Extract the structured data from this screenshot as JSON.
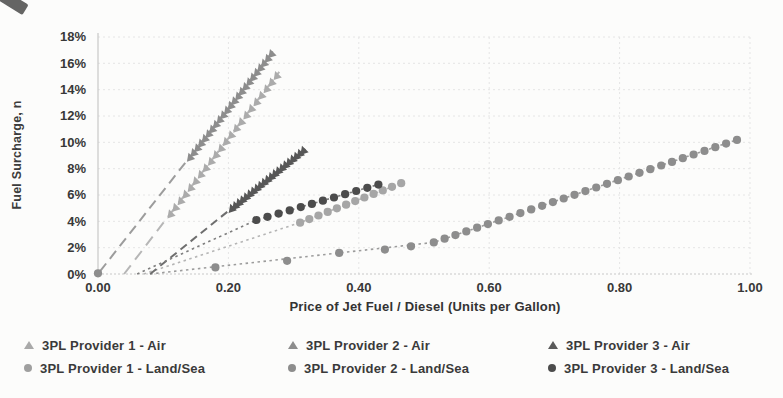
{
  "page": {
    "background": "#fcfcfb"
  },
  "chart_data": {
    "type": "scatter",
    "title": "",
    "xlabel": "Price of Jet Fuel / Diesel (Units per Gallon)",
    "ylabel": "Fuel Surcharge, n",
    "xlim": [
      0.0,
      1.0
    ],
    "ylim_percent": [
      0,
      18
    ],
    "grid": true,
    "legend_position": "bottom",
    "x_ticks": [
      {
        "value": 0.0,
        "label": "0.00"
      },
      {
        "value": 0.2,
        "label": "0.20"
      },
      {
        "value": 0.4,
        "label": "0.40"
      },
      {
        "value": 0.6,
        "label": "0.60"
      },
      {
        "value": 0.8,
        "label": "0.80"
      },
      {
        "value": 1.0,
        "label": "1.00"
      }
    ],
    "y_ticks": [
      {
        "value": 0,
        "label": "0%"
      },
      {
        "value": 2,
        "label": "2%"
      },
      {
        "value": 4,
        "label": "4%"
      },
      {
        "value": 6,
        "label": "6%"
      },
      {
        "value": 8,
        "label": "8%"
      },
      {
        "value": 10,
        "label": "10%"
      },
      {
        "value": 12,
        "label": "12%"
      },
      {
        "value": 14,
        "label": "14%"
      },
      {
        "value": 16,
        "label": "16%"
      },
      {
        "value": 18,
        "label": "18%"
      }
    ],
    "series": [
      {
        "name": "3PL Provider 1 - Air",
        "marker": "triangle",
        "color": "#ababab",
        "segment": {
          "x_start": 0.111,
          "x_end": 0.274,
          "n": 22,
          "slope_pct_per_unit": 64.5,
          "intercept_pct": -2.58
        },
        "endpoints_pct": [
          [
            0.111,
            4.6
          ],
          [
            0.274,
            15.1
          ]
        ],
        "trendline": {
          "points": [
            [
              0.04,
              0.0
            ],
            [
              0.278,
              15.35
            ]
          ],
          "dash": "11,7",
          "color": "#b6b6b6",
          "width": 2
        }
      },
      {
        "name": "3PL Provider 2 - Air",
        "marker": "triangle",
        "color": "#8d8d8d",
        "segment": {
          "x_start": 0.141,
          "x_end": 0.266,
          "n": 23,
          "slope_pct_per_unit": 63.0,
          "intercept_pct": 0.0
        },
        "endpoints_pct": [
          [
            0.141,
            8.9
          ],
          [
            0.266,
            16.8
          ]
        ],
        "trendline": {
          "points": [
            [
              0.003,
              0.2
            ],
            [
              0.268,
              16.9
            ]
          ],
          "dash": "10,6",
          "color": "#9c9c9c",
          "width": 2
        }
      },
      {
        "name": "3PL Provider 3 - Air",
        "marker": "triangle",
        "color": "#575757",
        "segment": {
          "x_start": 0.205,
          "x_end": 0.315,
          "n": 21,
          "slope_pct_per_unit": 40.0,
          "intercept_pct": -3.2
        },
        "endpoints_pct": [
          [
            0.205,
            5.0
          ],
          [
            0.315,
            9.4
          ]
        ],
        "trendline": {
          "points": [
            [
              0.08,
              0.0
            ],
            [
              0.318,
              9.5
            ]
          ],
          "dash": "8,5",
          "color": "#6e6e6e",
          "width": 2
        }
      },
      {
        "name": "3PL Provider 1 - Land/Sea",
        "marker": "circle",
        "color": "#a6a6a6",
        "segment": {
          "x_start": 0.31,
          "x_end": 0.465,
          "n": 12,
          "slope_pct_per_unit": 19.35,
          "intercept_pct": -2.1
        },
        "endpoints_pct": [
          [
            0.31,
            3.9
          ],
          [
            0.465,
            6.9
          ]
        ],
        "trendline": {
          "points": [
            [
              0.07,
              0.0
            ],
            [
              0.31,
              3.9
            ],
            [
              0.465,
              6.9
            ]
          ],
          "dash": "2.5,3.5",
          "color": "#b5b5b5",
          "width": 1.6
        }
      },
      {
        "name": "3PL Provider 2 - Land/Sea",
        "marker": "circle",
        "color": "#8d8d8d",
        "points_pct": [
          [
            0.0,
            0.05
          ],
          [
            0.18,
            0.5
          ],
          [
            0.29,
            1.0
          ],
          [
            0.37,
            1.6
          ],
          [
            0.44,
            1.85
          ],
          [
            0.48,
            2.1
          ]
        ],
        "segment": {
          "x_start": 0.515,
          "x_end": 0.98,
          "n": 29,
          "slope_pct_per_unit": 16.74,
          "intercept_pct": -6.22
        },
        "endpoints_pct": [
          [
            0.515,
            2.4
          ],
          [
            0.98,
            10.2
          ]
        ],
        "trendline": {
          "points": [
            [
              0.08,
              0.0
            ],
            [
              0.515,
              2.4
            ],
            [
              0.98,
              10.2
            ]
          ],
          "dash": "2.5,3.5",
          "color": "#9c9c9c",
          "width": 1.6
        }
      },
      {
        "name": "3PL Provider 3 - Land/Sea",
        "marker": "circle",
        "color": "#4c4c4c",
        "segment": {
          "x_start": 0.243,
          "x_end": 0.43,
          "n": 12,
          "slope_pct_per_unit": 14.4,
          "intercept_pct": 0.6
        },
        "endpoints_pct": [
          [
            0.243,
            4.1
          ],
          [
            0.43,
            6.8
          ]
        ],
        "trendline": {
          "points": [
            [
              0.06,
              0.0
            ],
            [
              0.243,
              4.1
            ],
            [
              0.43,
              6.8
            ]
          ],
          "dash": "2.5,3.5",
          "color": "#7e7e7e",
          "width": 1.6
        }
      }
    ]
  },
  "axes": {
    "y_title": "Fuel Surcharge, n",
    "x_title": "Price of Jet Fuel / Diesel (Units per Gallon)"
  },
  "legend": {
    "items": [
      {
        "label": "3PL Provider 1 - Air",
        "marker": "triangle",
        "color": "#a9a9a9",
        "col": 0,
        "row": 0
      },
      {
        "label": "3PL Provider 1 - Land/Sea",
        "marker": "circle",
        "color": "#9f9f9f",
        "col": 0,
        "row": 1
      },
      {
        "label": "3PL Provider 2 - Air",
        "marker": "triangle",
        "color": "#8d8d8d",
        "col": 1,
        "row": 0
      },
      {
        "label": "3PL Provider 2 - Land/Sea",
        "marker": "circle",
        "color": "#8d8d8d",
        "col": 1,
        "row": 1
      },
      {
        "label": "3PL Provider 3 - Air",
        "marker": "triangle",
        "color": "#5a5a5a",
        "col": 2,
        "row": 0
      },
      {
        "label": "3PL Provider 3 - Land/Sea",
        "marker": "circle",
        "color": "#4c4c4c",
        "col": 2,
        "row": 1
      }
    ],
    "col_offsets_px": [
      24,
      288,
      548
    ],
    "row_offsets_px": [
      7,
      30
    ]
  },
  "colors": {
    "grid": "#e5e5e5",
    "axis_line": "#c8c8c8",
    "tick_text": "#383838"
  }
}
